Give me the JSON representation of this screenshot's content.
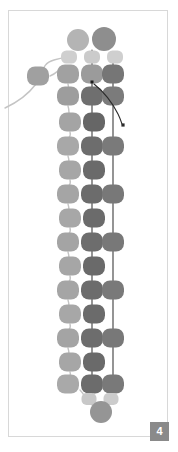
{
  "figure": {
    "caption_badge": "4",
    "background": "#ffffff",
    "frame_color": "#d8d8d8",
    "badge_color": "#8a8a8a",
    "badge_text_color": "#ffffff",
    "palette": {
      "light": "#a8a8a8",
      "pale": "#c9c9c9",
      "mid": "#9a9a9a",
      "dark": "#6d6d6d",
      "darker": "#5f5f5f",
      "link": "#c4c4c4",
      "strand": "#3a3a3a"
    },
    "columns": {
      "left": 68,
      "center": 92,
      "right": 113
    },
    "nodes": [
      {
        "name": "cap-top-left",
        "shape": "circle",
        "cx": 78,
        "cy": 40,
        "r": 11,
        "fill": "#b4b4b4"
      },
      {
        "name": "cap-top-right",
        "shape": "circle",
        "cx": 104,
        "cy": 39,
        "r": 12,
        "fill": "#8e8e8e"
      },
      {
        "name": "small-cap-a",
        "shape": "rrect",
        "cx": 69,
        "cy": 57,
        "w": 16,
        "h": 13,
        "fill": "#cfcfcf"
      },
      {
        "name": "small-cap-b",
        "shape": "rrect",
        "cx": 92,
        "cy": 57,
        "w": 16,
        "h": 13,
        "fill": "#cbcbcb"
      },
      {
        "name": "small-cap-c",
        "shape": "rrect",
        "cx": 115,
        "cy": 57,
        "w": 16,
        "h": 13,
        "fill": "#cfcfcf"
      },
      {
        "name": "detached-node",
        "shape": "rrect",
        "cx": 38,
        "cy": 76,
        "w": 22,
        "h": 19,
        "fill": "#a0a0a0"
      },
      {
        "name": "row1-left",
        "shape": "rrect",
        "cx": 68,
        "cy": 74,
        "w": 22,
        "h": 19,
        "fill": "#a1a1a1"
      },
      {
        "name": "row1-center",
        "shape": "rrect",
        "cx": 92,
        "cy": 74,
        "w": 22,
        "h": 19,
        "fill": "#9b9b9b"
      },
      {
        "name": "row1-right",
        "shape": "rrect",
        "cx": 113,
        "cy": 74,
        "w": 22,
        "h": 19,
        "fill": "#767676"
      },
      {
        "name": "row2-left",
        "shape": "rrect",
        "cx": 68,
        "cy": 96,
        "w": 22,
        "h": 19,
        "fill": "#9d9d9d"
      },
      {
        "name": "row2-center",
        "shape": "rrect",
        "cx": 92,
        "cy": 96,
        "w": 22,
        "h": 19,
        "fill": "#6f6f6f"
      },
      {
        "name": "row2-right",
        "shape": "rrect",
        "cx": 113,
        "cy": 96,
        "w": 22,
        "h": 19,
        "fill": "#7b7b7b"
      },
      {
        "name": "row3-left",
        "shape": "rrect",
        "cx": 70,
        "cy": 122,
        "w": 22,
        "h": 19,
        "fill": "#a4a4a4"
      },
      {
        "name": "row3-center",
        "shape": "rrect",
        "cx": 94,
        "cy": 122,
        "w": 22,
        "h": 19,
        "fill": "#666666"
      },
      {
        "name": "row4-left",
        "shape": "rrect",
        "cx": 68,
        "cy": 146,
        "w": 22,
        "h": 19,
        "fill": "#a8a8a8"
      },
      {
        "name": "row4-center",
        "shape": "rrect",
        "cx": 92,
        "cy": 146,
        "w": 22,
        "h": 19,
        "fill": "#6d6d6d"
      },
      {
        "name": "row4-right",
        "shape": "rrect",
        "cx": 113,
        "cy": 146,
        "w": 22,
        "h": 19,
        "fill": "#7a7a7a"
      },
      {
        "name": "row5-left",
        "shape": "rrect",
        "cx": 70,
        "cy": 170,
        "w": 22,
        "h": 19,
        "fill": "#a6a6a6"
      },
      {
        "name": "row5-center",
        "shape": "rrect",
        "cx": 94,
        "cy": 170,
        "w": 22,
        "h": 19,
        "fill": "#6a6a6a"
      },
      {
        "name": "row6-left",
        "shape": "rrect",
        "cx": 68,
        "cy": 194,
        "w": 22,
        "h": 19,
        "fill": "#a5a5a5"
      },
      {
        "name": "row6-center",
        "shape": "rrect",
        "cx": 92,
        "cy": 194,
        "w": 22,
        "h": 19,
        "fill": "#6c6c6c"
      },
      {
        "name": "row6-right",
        "shape": "rrect",
        "cx": 113,
        "cy": 194,
        "w": 22,
        "h": 19,
        "fill": "#787878"
      },
      {
        "name": "row7-left",
        "shape": "rrect",
        "cx": 70,
        "cy": 218,
        "w": 22,
        "h": 19,
        "fill": "#a7a7a7"
      },
      {
        "name": "row7-center",
        "shape": "rrect",
        "cx": 94,
        "cy": 218,
        "w": 22,
        "h": 19,
        "fill": "#6b6b6b"
      },
      {
        "name": "row8-left",
        "shape": "rrect",
        "cx": 68,
        "cy": 242,
        "w": 22,
        "h": 19,
        "fill": "#a4a4a4"
      },
      {
        "name": "row8-center",
        "shape": "rrect",
        "cx": 92,
        "cy": 242,
        "w": 22,
        "h": 19,
        "fill": "#6d6d6d"
      },
      {
        "name": "row8-right",
        "shape": "rrect",
        "cx": 113,
        "cy": 242,
        "w": 22,
        "h": 19,
        "fill": "#787878"
      },
      {
        "name": "row9-left",
        "shape": "rrect",
        "cx": 70,
        "cy": 266,
        "w": 22,
        "h": 19,
        "fill": "#a6a6a6"
      },
      {
        "name": "row9-center",
        "shape": "rrect",
        "cx": 94,
        "cy": 266,
        "w": 22,
        "h": 19,
        "fill": "#6a6a6a"
      },
      {
        "name": "row10-left",
        "shape": "rrect",
        "cx": 68,
        "cy": 290,
        "w": 22,
        "h": 19,
        "fill": "#a5a5a5"
      },
      {
        "name": "row10-center",
        "shape": "rrect",
        "cx": 92,
        "cy": 290,
        "w": 22,
        "h": 19,
        "fill": "#6c6c6c"
      },
      {
        "name": "row10-right",
        "shape": "rrect",
        "cx": 113,
        "cy": 290,
        "w": 22,
        "h": 19,
        "fill": "#797979"
      },
      {
        "name": "row11-left",
        "shape": "rrect",
        "cx": 70,
        "cy": 314,
        "w": 22,
        "h": 19,
        "fill": "#a7a7a7"
      },
      {
        "name": "row11-center",
        "shape": "rrect",
        "cx": 94,
        "cy": 314,
        "w": 22,
        "h": 19,
        "fill": "#6b6b6b"
      },
      {
        "name": "row12-left",
        "shape": "rrect",
        "cx": 68,
        "cy": 338,
        "w": 22,
        "h": 19,
        "fill": "#a4a4a4"
      },
      {
        "name": "row12-center",
        "shape": "rrect",
        "cx": 92,
        "cy": 338,
        "w": 22,
        "h": 19,
        "fill": "#6d6d6d"
      },
      {
        "name": "row12-right",
        "shape": "rrect",
        "cx": 113,
        "cy": 338,
        "w": 22,
        "h": 19,
        "fill": "#787878"
      },
      {
        "name": "row13-left",
        "shape": "rrect",
        "cx": 70,
        "cy": 362,
        "w": 22,
        "h": 19,
        "fill": "#a6a6a6"
      },
      {
        "name": "row13-center",
        "shape": "rrect",
        "cx": 94,
        "cy": 362,
        "w": 22,
        "h": 19,
        "fill": "#6a6a6a"
      },
      {
        "name": "row14-left",
        "shape": "rrect",
        "cx": 68,
        "cy": 384,
        "w": 22,
        "h": 19,
        "fill": "#a9a9a9"
      },
      {
        "name": "row14-center",
        "shape": "rrect",
        "cx": 92,
        "cy": 384,
        "w": 22,
        "h": 19,
        "fill": "#6c6c6c"
      },
      {
        "name": "row14-right",
        "shape": "rrect",
        "cx": 113,
        "cy": 384,
        "w": 22,
        "h": 19,
        "fill": "#797979"
      },
      {
        "name": "small-foot-a",
        "shape": "rrect",
        "cx": 89,
        "cy": 399,
        "w": 15,
        "h": 12,
        "fill": "#c8c8c8"
      },
      {
        "name": "small-foot-b",
        "shape": "rrect",
        "cx": 111,
        "cy": 399,
        "w": 15,
        "h": 12,
        "fill": "#cccccc"
      },
      {
        "name": "cap-bottom",
        "shape": "circle",
        "cx": 101,
        "cy": 412,
        "r": 11,
        "fill": "#959595"
      }
    ],
    "strands": [
      {
        "name": "strand-left",
        "d": "M92,50 L92,404"
      },
      {
        "name": "strand-right",
        "d": "M113,52 L113,398"
      }
    ],
    "links": [
      {
        "name": "link-lasso",
        "d": "M5,108 C22,100 30,92 36,84 C44,74 40,64 54,60 C64,57 70,58 72,60"
      },
      {
        "name": "link-detached",
        "d": "M50,76 C56,74 58,70 62,68"
      },
      {
        "name": "link-r1",
        "d": "M68,84 C70,90 66,90 68,96"
      },
      {
        "name": "link-r2",
        "d": "M68,106 C70,112 68,114 70,118"
      },
      {
        "name": "link-r3",
        "d": "M70,132 C72,138 66,138 68,142"
      },
      {
        "name": "link-r4",
        "d": "M68,156 C70,162 68,164 70,166"
      },
      {
        "name": "link-r5",
        "d": "M70,180 C72,186 66,186 68,190"
      },
      {
        "name": "link-r6",
        "d": "M68,204 C70,210 68,212 70,214"
      },
      {
        "name": "link-r7",
        "d": "M70,228 C72,234 66,234 68,238"
      },
      {
        "name": "link-r8",
        "d": "M68,252 C70,258 68,260 70,262"
      },
      {
        "name": "link-r9",
        "d": "M70,276 C72,282 66,282 68,286"
      },
      {
        "name": "link-r10",
        "d": "M68,300 C70,306 68,308 70,310"
      },
      {
        "name": "link-r11",
        "d": "M70,324 C72,330 66,330 68,334"
      },
      {
        "name": "link-r12",
        "d": "M68,348 C70,354 68,356 70,358"
      },
      {
        "name": "link-r13",
        "d": "M70,372 C72,378 66,378 68,380"
      },
      {
        "name": "link-r14",
        "d": "M80,390 C86,396 84,398 86,399"
      },
      {
        "name": "link-foot",
        "d": "M92,405 C96,409 98,410 100,411"
      }
    ],
    "pointer": {
      "name": "arrow-pointer",
      "d": "M94,84 C104,92 112,102 118,114 C120,118 121,121 122,124",
      "head_x": 123,
      "head_y": 125,
      "color": "#2b2b2b"
    },
    "marker": {
      "name": "marker-dot",
      "x": 92,
      "y": 82,
      "size": 3,
      "color": "#1d1d1d"
    }
  }
}
